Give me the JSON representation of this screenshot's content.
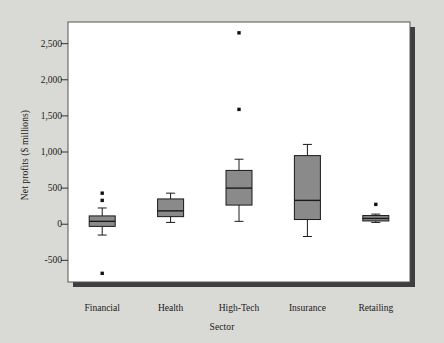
{
  "chart_data": {
    "type": "box",
    "title": "",
    "xlabel": "Sector",
    "ylabel": "Net profits ($ millions)",
    "ylim": [
      -800,
      2800
    ],
    "yticks": [
      -500,
      0,
      500,
      1000,
      1500,
      2000,
      2500
    ],
    "ytick_labels": [
      "-500",
      "0",
      "500",
      "1,000",
      "1,500",
      "2,000",
      "2,500"
    ],
    "categories": [
      "Financial",
      "Health",
      "High-Tech",
      "Insurance",
      "Retailing"
    ],
    "grid": false,
    "legend": "none",
    "box_color": "#8a8a8a",
    "line_color": "#1a1a1a",
    "boxes": [
      {
        "category": "Financial",
        "whisker_low": -150,
        "q1": -30,
        "median": 40,
        "q3": 115,
        "whisker_high": 225,
        "outliers": [
          330,
          430,
          -680
        ]
      },
      {
        "category": "Health",
        "whisker_low": 25,
        "q1": 105,
        "median": 185,
        "q3": 350,
        "whisker_high": 430,
        "outliers": []
      },
      {
        "category": "High-Tech",
        "whisker_low": 40,
        "q1": 265,
        "median": 500,
        "q3": 745,
        "whisker_high": 900,
        "outliers": [
          1590,
          2650
        ]
      },
      {
        "category": "Insurance",
        "whisker_low": -170,
        "q1": 65,
        "median": 330,
        "q3": 950,
        "whisker_high": 1105,
        "outliers": []
      },
      {
        "category": "Retailing",
        "whisker_low": 25,
        "q1": 45,
        "median": 80,
        "q3": 120,
        "whisker_high": 140,
        "outliers": [
          275
        ]
      }
    ]
  }
}
